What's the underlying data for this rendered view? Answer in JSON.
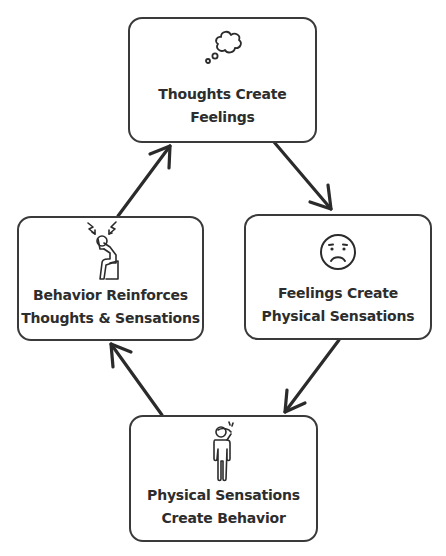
{
  "diagram": {
    "type": "cycle",
    "colors": {
      "stroke": "#3a3a3a",
      "text": "#2d2d2d",
      "background": "#ffffff"
    },
    "nodes": [
      {
        "id": "thoughts",
        "icon": "thought-bubble-icon",
        "line1": "Thoughts Create",
        "line2": "Feelings"
      },
      {
        "id": "feelings",
        "icon": "sad-face-icon",
        "line1": "Feelings Create",
        "line2": "Physical Sensations"
      },
      {
        "id": "sensations",
        "icon": "person-headache-icon",
        "line1": "Physical Sensations",
        "line2": "Create Behavior"
      },
      {
        "id": "behavior",
        "icon": "stressed-person-sitting-icon",
        "line1": "Behavior Reinforces",
        "line2": "Thoughts & Sensations"
      }
    ],
    "edges": [
      {
        "from": "thoughts",
        "to": "feelings"
      },
      {
        "from": "feelings",
        "to": "sensations"
      },
      {
        "from": "sensations",
        "to": "behavior"
      },
      {
        "from": "behavior",
        "to": "thoughts"
      }
    ]
  }
}
